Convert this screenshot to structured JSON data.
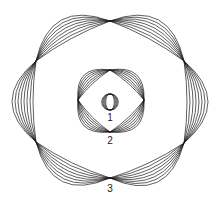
{
  "diagram": {
    "stroke_color": "#1a1a1a",
    "background": "#ffffff",
    "labels": [
      {
        "text": "1",
        "x": 110,
        "y": 121
      },
      {
        "text": "2",
        "x": 110,
        "y": 144
      },
      {
        "text": "3",
        "x": 110,
        "y": 192
      }
    ],
    "figures": [
      {
        "id": 1,
        "kind": "lens",
        "center": [
          110,
          102
        ],
        "vertices": [
          [
            110,
            94
          ],
          [
            110,
            110
          ]
        ],
        "arcs_per_side": 5,
        "max_bulge": 11
      },
      {
        "id": 2,
        "kind": "polygon-ring",
        "sides": 4,
        "vertices": [
          [
            110,
            70
          ],
          [
            144,
            100
          ],
          [
            110,
            132
          ],
          [
            78,
            100
          ]
        ],
        "arcs_per_side": 7,
        "max_bulge": 14
      },
      {
        "id": 3,
        "kind": "polygon-ring",
        "sides": 6,
        "vertices": [
          [
            110,
            21
          ],
          [
            184,
            61
          ],
          [
            184,
            143
          ],
          [
            110,
            178
          ],
          [
            36,
            142
          ],
          [
            36,
            61
          ]
        ],
        "arcs_per_side": 8,
        "max_bulge": 24
      }
    ]
  }
}
